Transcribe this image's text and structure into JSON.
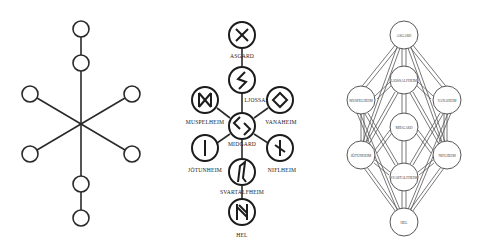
{
  "figure": {
    "panels": [
      {
        "id": "plain",
        "description": "Unlabeled nine-node star schematic of the world tree",
        "nodes": 8
      },
      {
        "id": "runic",
        "description": "Runic world-tree diagram",
        "nodes": [
          {
            "label": "ASGARD",
            "rune": "gebo"
          },
          {
            "label": "LJOSSALFHEIM",
            "rune": "sowilo"
          },
          {
            "label": "MUSPELHEIM",
            "rune": "dagaz"
          },
          {
            "label": "VANAHEIM",
            "rune": "ingwaz"
          },
          {
            "label": "MIDGARD",
            "rune": "jera"
          },
          {
            "label": "JÖTUNHEIM",
            "rune": "isa"
          },
          {
            "label": "NIFLHEIM",
            "rune": "naudiz"
          },
          {
            "label": "SVARTALFHEIM",
            "rune": "eihwaz"
          },
          {
            "label": "HEL",
            "rune": "hagalaz"
          }
        ]
      },
      {
        "id": "connected",
        "description": "Fully interconnected world-tree lattice",
        "nodes": [
          {
            "label": "ASGARD"
          },
          {
            "label": "LJOSSALFHEIM"
          },
          {
            "label": "MUSPELHEIM"
          },
          {
            "label": "VANAHEIM"
          },
          {
            "label": "MIDGARD"
          },
          {
            "label": "JÖTUNHEIM"
          },
          {
            "label": "NIFLHEIM"
          },
          {
            "label": "SVARTALFHEIM"
          },
          {
            "label": "HEL"
          }
        ]
      }
    ]
  }
}
